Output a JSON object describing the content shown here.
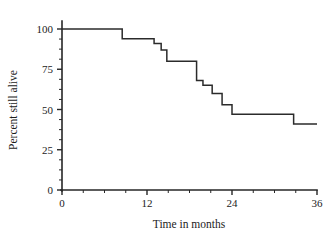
{
  "chart_data": {
    "type": "line",
    "title": "",
    "xlabel": "Time in months",
    "ylabel": "Percent still alive",
    "xlim": [
      0,
      36
    ],
    "ylim": [
      0,
      100
    ],
    "xticks": [
      0,
      12,
      24,
      36
    ],
    "xtick_labels": [
      "0",
      "12",
      "24",
      "36"
    ],
    "x_minor_tick_interval": 3,
    "yticks": [
      0,
      25,
      50,
      75,
      100
    ],
    "ytick_labels": [
      "0",
      "25",
      "50",
      "75",
      "100"
    ],
    "y_minor_tick_interval": 6.25,
    "grid": false,
    "legend": false,
    "series": [
      {
        "name": "Survival",
        "step_style": "post",
        "x": [
          0,
          8.5,
          8.5,
          13.0,
          13.0,
          14.0,
          14.0,
          14.8,
          14.8,
          19.0,
          19.0,
          19.9,
          19.9,
          21.2,
          21.2,
          22.6,
          22.6,
          24.0,
          24.0,
          32.7,
          32.7,
          36.0
        ],
        "y": [
          100,
          100,
          94,
          94,
          91,
          91,
          87,
          87,
          80,
          80,
          68,
          68,
          65,
          65,
          60,
          60,
          53,
          53,
          47,
          47,
          41,
          41
        ]
      }
    ]
  },
  "axis_titles": {
    "x": "Time in months",
    "y": "Percent still alive"
  },
  "colors": {
    "curve": "#2b2b2b",
    "axis": "#262626",
    "text": "#1c1c1c",
    "background": "#ffffff"
  }
}
